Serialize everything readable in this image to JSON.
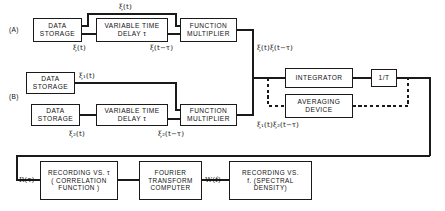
{
  "figure": {
    "type": "block-diagram"
  },
  "rows": {
    "a_label": "(A)",
    "b_label": "(B)"
  },
  "blocks": {
    "a_data_storage": "DATA\nSTORAGE",
    "a_delay": "VARIABLE  TIME\nDELAY  τ",
    "a_multiplier": "FUNCTION\nMULTIPLIER",
    "b_data_storage_1": "DATA\nSTORAGE",
    "b_data_storage_2": "DATA\nSTORAGE",
    "b_delay": "VARIABLE  TIME\nDELAY  τ",
    "b_multiplier": "FUNCTION\nMULTIPLIER",
    "integrator": "INTEGRATOR",
    "averaging_device": "AVERAGING\nDEVICE",
    "gain": "1/T",
    "recording_correlation": "RECORDING VS. τ\n( CORRELATION\nFUNCTION )",
    "fourier_computer": "FOURIER\nTRANSFORM\nCOMPUTER",
    "recording_spectral": "RECORDING  VS.\nf. (SPECTRAL\nDENSITY)"
  },
  "signal_labels": {
    "a_top_feed": "ξ(t)",
    "a_storage_out": "ξ(t)",
    "a_delay_out": "ξ(t−τ)",
    "a_product": "ξ(t)ξ(t−τ)",
    "b_storage1_out": "ξ₁(t)",
    "b_storage2_out": "ξ₂(t)",
    "b_delay_out": "ξ₂(t−τ)",
    "b_product": "ξ₁(t)ξ₂(t−τ)",
    "correlation_out": "R(τ)",
    "spectral_in": "W(f)"
  },
  "colors": {
    "ink": "#1a1a1a",
    "paper": "#ffffff"
  }
}
